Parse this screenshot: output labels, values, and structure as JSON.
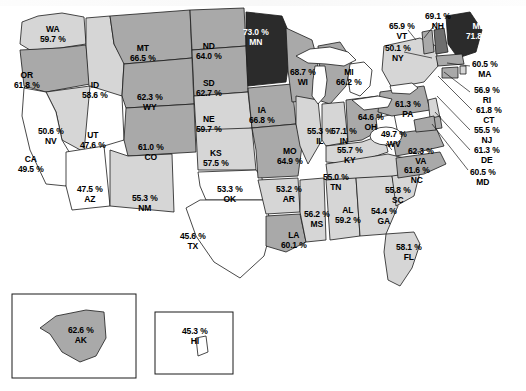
{
  "figure": {
    "type": "choropleth-map",
    "region": "United States",
    "unit": "%"
  },
  "legend_shades": {
    "lowest": "#ffffff",
    "low": "#d6d6d6",
    "mid": "#a9a9a9",
    "high": "#6e6e6e",
    "highest": "#2b2b2b"
  },
  "insets": [
    {
      "name": "alaska-inset",
      "label": "AK"
    },
    {
      "name": "hawaii-inset",
      "label": "HI"
    }
  ],
  "chart_data": {
    "type": "heatmap",
    "title": "",
    "xlabel": "",
    "ylabel": "",
    "categories": [
      "WA",
      "OR",
      "ID",
      "MT",
      "ND",
      "SD",
      "WY",
      "NE",
      "NV",
      "UT",
      "CO",
      "KS",
      "CA",
      "AZ",
      "NM",
      "OK",
      "TX",
      "MN",
      "IA",
      "MO",
      "AR",
      "LA",
      "WI",
      "IL",
      "MS",
      "MI",
      "IN",
      "KY",
      "TN",
      "AL",
      "OH",
      "WV",
      "GA",
      "FL",
      "SC",
      "NC",
      "VA",
      "PA",
      "NY",
      "VT",
      "NH",
      "ME",
      "MA",
      "RI",
      "CT",
      "NJ",
      "DE",
      "MD",
      "AK",
      "HI"
    ],
    "values": [
      59.7,
      61.8,
      58.6,
      66.5,
      64.0,
      62.7,
      62.3,
      59.7,
      50.6,
      47.6,
      61.0,
      57.5,
      49.5,
      47.5,
      55.3,
      53.3,
      45.6,
      73.0,
      66.8,
      64.9,
      53.2,
      60.1,
      68.7,
      55.3,
      56.2,
      66.2,
      57.1,
      55.7,
      55.0,
      59.2,
      64.6,
      49.7,
      54.4,
      58.1,
      55.8,
      61.6,
      62.3,
      61.3,
      50.1,
      65.9,
      69.1,
      71.8,
      60.5,
      56.9,
      61.8,
      55.5,
      61.3,
      60.5,
      62.6,
      45.3
    ],
    "ylim": [
      45.3,
      73.0
    ]
  },
  "states": [
    {
      "abbr": "WA",
      "value": "59.7 %",
      "shade": "low",
      "lx": 40,
      "ly": 25
    },
    {
      "abbr": "OR",
      "value": "61.8 %",
      "shade": "mid",
      "lx": 14,
      "ly": 71
    },
    {
      "abbr": "ID",
      "value": "58.6 %",
      "shade": "low",
      "lx": 82,
      "ly": 81
    },
    {
      "abbr": "MT",
      "value": "66.5 %",
      "shade": "mid",
      "lx": 130,
      "ly": 44
    },
    {
      "abbr": "ND",
      "value": "64.0 %",
      "shade": "mid",
      "lx": 196,
      "ly": 42
    },
    {
      "abbr": "SD",
      "value": "62.7 %",
      "shade": "mid",
      "lx": 196,
      "ly": 79
    },
    {
      "abbr": "WY",
      "value": "62.3 %",
      "shade": "mid",
      "lx": 137,
      "ly": 93
    },
    {
      "abbr": "NE",
      "value": "59.7 %",
      "shade": "low",
      "lx": 196,
      "ly": 115
    },
    {
      "abbr": "NV",
      "value": "50.6 %",
      "shade": "low",
      "lx": 38,
      "ly": 127
    },
    {
      "abbr": "UT",
      "value": "47.6 %",
      "shade": "lowest",
      "lx": 80,
      "ly": 131
    },
    {
      "abbr": "CO",
      "value": "61.0 %",
      "shade": "mid",
      "lx": 138,
      "ly": 143
    },
    {
      "abbr": "KS",
      "value": "57.5 %",
      "shade": "low",
      "lx": 203,
      "ly": 149
    },
    {
      "abbr": "CA",
      "value": "49.5 %",
      "shade": "lowest",
      "lx": 18,
      "ly": 155
    },
    {
      "abbr": "AZ",
      "value": "47.5 %",
      "shade": "lowest",
      "lx": 77,
      "ly": 185
    },
    {
      "abbr": "NM",
      "value": "55.3 %",
      "shade": "low",
      "lx": 132,
      "ly": 194
    },
    {
      "abbr": "OK",
      "value": "53.3 %",
      "shade": "lowest",
      "lx": 217,
      "ly": 185
    },
    {
      "abbr": "TX",
      "value": "45.6 %",
      "shade": "lowest",
      "lx": 180,
      "ly": 232
    },
    {
      "abbr": "MN",
      "value": "73.0 %",
      "shade": "highest",
      "lx": 243,
      "ly": 28
    },
    {
      "abbr": "IA",
      "value": "66.8 %",
      "shade": "mid",
      "lx": 249,
      "ly": 106
    },
    {
      "abbr": "MO",
      "value": "64.9 %",
      "shade": "mid",
      "lx": 277,
      "ly": 147
    },
    {
      "abbr": "AR",
      "value": "53.2 %",
      "shade": "low",
      "lx": 276,
      "ly": 185
    },
    {
      "abbr": "LA",
      "value": "60.1 %",
      "shade": "mid",
      "lx": 281,
      "ly": 231
    },
    {
      "abbr": "WI",
      "value": "68.7 %",
      "shade": "mid",
      "lx": 290,
      "ly": 68
    },
    {
      "abbr": "IL",
      "value": "55.3 %",
      "shade": "low",
      "lx": 307,
      "ly": 127
    },
    {
      "abbr": "MS",
      "value": "56.2 %",
      "shade": "low",
      "lx": 304,
      "ly": 210
    },
    {
      "abbr": "MI",
      "value": "66.2 %",
      "shade": "mid",
      "lx": 336,
      "ly": 68
    },
    {
      "abbr": "IN",
      "value": "57.1 %",
      "shade": "low",
      "lx": 331,
      "ly": 127
    },
    {
      "abbr": "KY",
      "value": "55.7 %",
      "shade": "low",
      "lx": 337,
      "ly": 146
    },
    {
      "abbr": "TN",
      "value": "55.0 %",
      "shade": "low",
      "lx": 323,
      "ly": 173
    },
    {
      "abbr": "AL",
      "value": "59.2 %",
      "shade": "low",
      "lx": 335,
      "ly": 206
    },
    {
      "abbr": "OH",
      "value": "64.6 %",
      "shade": "mid",
      "lx": 358,
      "ly": 113
    },
    {
      "abbr": "WV",
      "value": "49.7 %",
      "shade": "lowest",
      "lx": 381,
      "ly": 130
    },
    {
      "abbr": "GA",
      "value": "54.4 %",
      "shade": "low",
      "lx": 371,
      "ly": 207
    },
    {
      "abbr": "FL",
      "value": "58.1 %",
      "shade": "low",
      "lx": 396,
      "ly": 243
    },
    {
      "abbr": "SC",
      "value": "55.8 %",
      "shade": "low",
      "lx": 385,
      "ly": 186
    },
    {
      "abbr": "NC",
      "value": "61.6 %",
      "shade": "mid",
      "lx": 404,
      "ly": 166
    },
    {
      "abbr": "VA",
      "value": "62.3 %",
      "shade": "mid",
      "lx": 408,
      "ly": 147
    },
    {
      "abbr": "PA",
      "value": "61.3 %",
      "shade": "mid",
      "lx": 395,
      "ly": 100
    },
    {
      "abbr": "NY",
      "value": "50.1 %",
      "shade": "low",
      "lx": 385,
      "ly": 44
    },
    {
      "abbr": "VT",
      "value": "65.9 %",
      "shade": "mid",
      "lx": 389,
      "ly": 22
    },
    {
      "abbr": "NH",
      "value": "69.1 %",
      "shade": "high",
      "lx": 425,
      "ly": 12
    },
    {
      "abbr": "ME",
      "value": "71.8 %",
      "shade": "highest",
      "lx": 466,
      "ly": 22
    },
    {
      "abbr": "MA",
      "value": "60.5 %",
      "shade": "mid",
      "lx": 472,
      "ly": 60
    },
    {
      "abbr": "RI",
      "value": "56.9 %",
      "shade": "low",
      "lx": 474,
      "ly": 86
    },
    {
      "abbr": "CT",
      "value": "61.8 %",
      "shade": "mid",
      "lx": 476,
      "ly": 106
    },
    {
      "abbr": "NJ",
      "value": "55.5 %",
      "shade": "low",
      "lx": 474,
      "ly": 126
    },
    {
      "abbr": "DE",
      "value": "61.3 %",
      "shade": "mid",
      "lx": 474,
      "ly": 146
    },
    {
      "abbr": "MD",
      "value": "60.5 %",
      "shade": "mid",
      "lx": 470,
      "ly": 168
    },
    {
      "abbr": "AK",
      "value": "62.6 %",
      "shade": "mid",
      "lx": 68,
      "ly": 326
    },
    {
      "abbr": "HI",
      "value": "45.3 %",
      "shade": "lowest",
      "lx": 182,
      "ly": 327
    }
  ]
}
